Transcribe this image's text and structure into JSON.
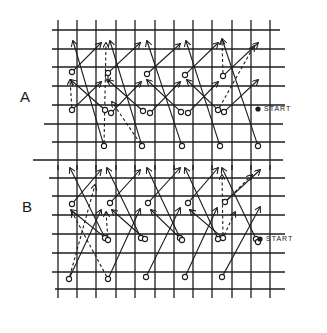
{
  "diagram": {
    "title": "",
    "panels": [
      {
        "id": "A",
        "label": "A",
        "start_label": "START",
        "label_pos": [
          20,
          88
        ],
        "start_text_pos": [
          264,
          100
        ],
        "start_dot": [
          258,
          109
        ],
        "grid": {
          "vlines": [
            58,
            77,
            96,
            116,
            135,
            155,
            174,
            193,
            212,
            232,
            251,
            270
          ],
          "vline_y": [
            20,
            170
          ],
          "hlines": [
            {
              "y": 30,
              "x1": 52,
              "x2": 280
            },
            {
              "y": 49,
              "x1": 52,
              "x2": 285
            },
            {
              "y": 67,
              "x1": 52,
              "x2": 285
            },
            {
              "y": 86,
              "x1": 52,
              "x2": 285
            },
            {
              "y": 105,
              "x1": 52,
              "x2": 285
            },
            {
              "y": 124,
              "x1": 44,
              "x2": 283
            },
            {
              "y": 142,
              "x1": 52,
              "x2": 285
            }
          ]
        },
        "nodes": [
          [
            72,
            72
          ],
          [
            108,
            73
          ],
          [
            147,
            74
          ],
          [
            185,
            75
          ],
          [
            223,
            76
          ],
          [
            72,
            110
          ],
          [
            105,
            110
          ],
          [
            111,
            113
          ],
          [
            143,
            111
          ],
          [
            150,
            113
          ],
          [
            181,
            112
          ],
          [
            188,
            113
          ],
          [
            218,
            110
          ],
          [
            224,
            112
          ],
          [
            104,
            146
          ],
          [
            142,
            146
          ],
          [
            182,
            146
          ],
          [
            220,
            146
          ],
          [
            258,
            146
          ]
        ],
        "arrows_solid": [
          [
            [
              72,
              72
            ],
            [
              101,
              43
            ]
          ],
          [
            [
              108,
              73
            ],
            [
              140,
              43
            ]
          ],
          [
            [
              147,
              74
            ],
            [
              180,
              44
            ]
          ],
          [
            [
              185,
              75
            ],
            [
              218,
              43
            ]
          ],
          [
            [
              223,
              76
            ],
            [
              258,
              43
            ]
          ],
          [
            [
              72,
              110
            ],
            [
              101,
              82
            ]
          ],
          [
            [
              111,
              113
            ],
            [
              141,
              82
            ]
          ],
          [
            [
              150,
              113
            ],
            [
              180,
              82
            ]
          ],
          [
            [
              188,
              113
            ],
            [
              218,
              82
            ]
          ],
          [
            [
              224,
              112
            ],
            [
              258,
              80
            ]
          ],
          [
            [
              104,
              146
            ],
            [
              73,
              41
            ]
          ],
          [
            [
              142,
              146
            ],
            [
              110,
              41
            ]
          ],
          [
            [
              182,
              146
            ],
            [
              147,
              41
            ]
          ],
          [
            [
              220,
              146
            ],
            [
              186,
              41
            ]
          ],
          [
            [
              258,
              146
            ],
            [
              222,
              39
            ]
          ],
          [
            [
              105,
              110
            ],
            [
              71,
              80
            ]
          ],
          [
            [
              143,
              111
            ],
            [
              108,
              80
            ]
          ],
          [
            [
              181,
              112
            ],
            [
              147,
              80
            ]
          ],
          [
            [
              218,
              110
            ],
            [
              187,
              80
            ]
          ]
        ],
        "arrows_dashed": [
          [
            [
              104,
              146
            ],
            [
              106,
              43
            ]
          ],
          [
            [
              72,
              110
            ],
            [
              70,
              80
            ]
          ],
          [
            [
              108,
              73
            ],
            [
              108,
              82
            ]
          ],
          [
            [
              142,
              146
            ],
            [
              112,
              102
            ]
          ],
          [
            [
              223,
              76
            ],
            [
              222,
              40
            ]
          ],
          [
            [
              218,
              110
            ],
            [
              254,
              46
            ]
          ]
        ]
      },
      {
        "id": "B",
        "label": "B",
        "start_label": "START",
        "label_pos": [
          22,
          198
        ],
        "start_text_pos": [
          266,
          234
        ],
        "start_dot": [
          260,
          239
        ],
        "grid": {
          "vlines": [
            58,
            77,
            96,
            116,
            135,
            155,
            174,
            193,
            212,
            232,
            251,
            270
          ],
          "vline_y": [
            165,
            298
          ],
          "hlines": [
            {
              "y": 160,
              "x1": 33,
              "x2": 283
            },
            {
              "y": 178,
              "x1": 49,
              "x2": 285
            },
            {
              "y": 196,
              "x1": 52,
              "x2": 285
            },
            {
              "y": 215,
              "x1": 52,
              "x2": 285
            },
            {
              "y": 234,
              "x1": 52,
              "x2": 285
            },
            {
              "y": 253,
              "x1": 52,
              "x2": 285
            },
            {
              "y": 272,
              "x1": 52,
              "x2": 285
            },
            {
              "y": 289,
              "x1": 55,
              "x2": 285
            }
          ]
        },
        "nodes": [
          [
            72,
            204
          ],
          [
            110,
            203
          ],
          [
            148,
            203
          ],
          [
            188,
            203
          ],
          [
            225,
            202
          ],
          [
            105,
            238
          ],
          [
            108,
            240
          ],
          [
            141,
            238
          ],
          [
            145,
            239
          ],
          [
            180,
            238
          ],
          [
            182,
            240
          ],
          [
            218,
            239
          ],
          [
            223,
            238
          ],
          [
            256,
            239
          ],
          [
            258,
            242
          ],
          [
            69,
            279
          ],
          [
            108,
            279
          ],
          [
            146,
            277
          ],
          [
            185,
            277
          ],
          [
            222,
            277
          ]
        ],
        "arrows_solid": [
          [
            [
              72,
              204
            ],
            [
              101,
              170
            ]
          ],
          [
            [
              110,
              203
            ],
            [
              140,
              170
            ]
          ],
          [
            [
              148,
              203
            ],
            [
              180,
              168
            ]
          ],
          [
            [
              188,
              203
            ],
            [
              218,
              168
            ]
          ],
          [
            [
              225,
              202
            ],
            [
              260,
              170
            ]
          ],
          [
            [
              69,
              279
            ],
            [
              101,
              210
            ]
          ],
          [
            [
              108,
              279
            ],
            [
              140,
              209
            ]
          ],
          [
            [
              146,
              277
            ],
            [
              180,
              208
            ]
          ],
          [
            [
              185,
              277
            ],
            [
              217,
              208
            ]
          ],
          [
            [
              222,
              277
            ],
            [
              260,
              207
            ]
          ],
          [
            [
              105,
              238
            ],
            [
              70,
              168
            ]
          ],
          [
            [
              141,
              238
            ],
            [
              107,
              168
            ]
          ],
          [
            [
              180,
              238
            ],
            [
              147,
              168
            ]
          ],
          [
            [
              218,
              239
            ],
            [
              185,
              168
            ]
          ],
          [
            [
              256,
              239
            ],
            [
              222,
              168
            ]
          ],
          [
            [
              108,
              240
            ],
            [
              71,
              210
            ]
          ],
          [
            [
              145,
              239
            ],
            [
              112,
              210
            ]
          ],
          [
            [
              182,
              240
            ],
            [
              151,
              210
            ]
          ],
          [
            [
              223,
              238
            ],
            [
              190,
              210
            ]
          ]
        ],
        "arrows_dashed": [
          [
            [
              69,
              279
            ],
            [
              95,
              185
            ]
          ],
          [
            [
              108,
              279
            ],
            [
              72,
              212
            ]
          ],
          [
            [
              108,
              240
            ],
            [
              106,
              212
            ]
          ],
          [
            [
              223,
              238
            ],
            [
              222,
              175
            ]
          ],
          [
            [
              225,
              202
            ],
            [
              252,
              175
            ]
          ],
          [
            [
              223,
              238
            ],
            [
              235,
              212
            ]
          ]
        ]
      }
    ]
  }
}
